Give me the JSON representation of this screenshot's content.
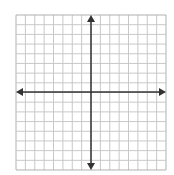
{
  "diagram": {
    "type": "coordinate-plane",
    "grid": {
      "columns": 16,
      "rows": 16,
      "left": 16,
      "top": 15,
      "right": 166,
      "bottom": 170,
      "line_color": "#c8c8c8",
      "border_color": "#b0b0b0"
    },
    "axes": {
      "x_axis_y": 92,
      "y_axis_x": 91,
      "color": "#333333",
      "arrows": [
        "left",
        "right",
        "up",
        "down"
      ]
    }
  }
}
